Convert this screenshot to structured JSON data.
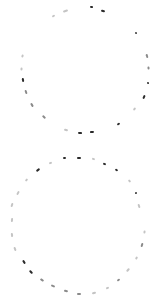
{
  "canvas": {
    "width": 159,
    "height": 304,
    "background": "#ffffff"
  },
  "colors": {
    "dark": "#2a2a2a",
    "mid": "#8a8a8a",
    "light": "#c4c4c4"
  },
  "circles": [
    {
      "name": "top-dashed-circle",
      "center": [
        85,
        72
      ],
      "radius": 62,
      "ticks": [
        {
          "x": 53,
          "y": 16,
          "shade": "light",
          "len": 3
        },
        {
          "x": 65,
          "y": 11,
          "shade": "light",
          "len": 5
        },
        {
          "x": 91,
          "y": 7,
          "shade": "dark",
          "len": 3
        },
        {
          "x": 103,
          "y": 11,
          "shade": "dark",
          "len": 4
        },
        {
          "x": 136,
          "y": 33,
          "shade": "dark",
          "len": 2
        },
        {
          "x": 147,
          "y": 56,
          "shade": "mid",
          "len": 4
        },
        {
          "x": 148,
          "y": 68,
          "shade": "mid",
          "len": 3
        },
        {
          "x": 148,
          "y": 83,
          "shade": "dark",
          "len": 2
        },
        {
          "x": 144,
          "y": 97,
          "shade": "dark",
          "len": 4
        },
        {
          "x": 134,
          "y": 109,
          "shade": "light",
          "len": 3
        },
        {
          "x": 118,
          "y": 124,
          "shade": "dark",
          "len": 3
        },
        {
          "x": 92,
          "y": 132,
          "shade": "dark",
          "len": 4
        },
        {
          "x": 80,
          "y": 133,
          "shade": "dark",
          "len": 4
        },
        {
          "x": 66,
          "y": 130,
          "shade": "light",
          "len": 4
        },
        {
          "x": 44,
          "y": 117,
          "shade": "mid",
          "len": 4
        },
        {
          "x": 32,
          "y": 105,
          "shade": "mid",
          "len": 4
        },
        {
          "x": 26,
          "y": 92,
          "shade": "mid",
          "len": 4
        },
        {
          "x": 23,
          "y": 80,
          "shade": "dark",
          "len": 4
        },
        {
          "x": 21,
          "y": 69,
          "shade": "light",
          "len": 3
        },
        {
          "x": 22,
          "y": 56,
          "shade": "light",
          "len": 3
        }
      ]
    },
    {
      "name": "bottom-dashed-circle",
      "center": [
        78,
        226
      ],
      "radius": 67,
      "ticks": [
        {
          "x": 64,
          "y": 158,
          "shade": "dark",
          "len": 3
        },
        {
          "x": 79,
          "y": 158,
          "shade": "dark",
          "len": 4
        },
        {
          "x": 93,
          "y": 159,
          "shade": "light",
          "len": 3
        },
        {
          "x": 104,
          "y": 164,
          "shade": "dark",
          "len": 3
        },
        {
          "x": 116,
          "y": 170,
          "shade": "dark",
          "len": 3
        },
        {
          "x": 129,
          "y": 181,
          "shade": "light",
          "len": 3
        },
        {
          "x": 136,
          "y": 193,
          "shade": "dark",
          "len": 2
        },
        {
          "x": 139,
          "y": 206,
          "shade": "light",
          "len": 4
        },
        {
          "x": 144,
          "y": 232,
          "shade": "light",
          "len": 3
        },
        {
          "x": 142,
          "y": 245,
          "shade": "mid",
          "len": 4
        },
        {
          "x": 136,
          "y": 258,
          "shade": "light",
          "len": 3
        },
        {
          "x": 128,
          "y": 270,
          "shade": "light",
          "len": 4
        },
        {
          "x": 118,
          "y": 280,
          "shade": "mid",
          "len": 3
        },
        {
          "x": 107,
          "y": 288,
          "shade": "light",
          "len": 3
        },
        {
          "x": 94,
          "y": 293,
          "shade": "light",
          "len": 4
        },
        {
          "x": 79,
          "y": 294,
          "shade": "mid",
          "len": 4
        },
        {
          "x": 66,
          "y": 291,
          "shade": "mid",
          "len": 4
        },
        {
          "x": 53,
          "y": 286,
          "shade": "mid",
          "len": 4
        },
        {
          "x": 42,
          "y": 280,
          "shade": "mid",
          "len": 4
        },
        {
          "x": 31,
          "y": 272,
          "shade": "dark",
          "len": 4
        },
        {
          "x": 24,
          "y": 262,
          "shade": "dark",
          "len": 4
        },
        {
          "x": 15,
          "y": 249,
          "shade": "light",
          "len": 4
        },
        {
          "x": 12,
          "y": 235,
          "shade": "light",
          "len": 4
        },
        {
          "x": 12,
          "y": 220,
          "shade": "light",
          "len": 4
        },
        {
          "x": 12,
          "y": 205,
          "shade": "light",
          "len": 4
        },
        {
          "x": 18,
          "y": 193,
          "shade": "light",
          "len": 4
        },
        {
          "x": 26,
          "y": 180,
          "shade": "light",
          "len": 3
        },
        {
          "x": 38,
          "y": 170,
          "shade": "dark",
          "len": 4
        },
        {
          "x": 50,
          "y": 163,
          "shade": "light",
          "len": 3
        }
      ]
    }
  ]
}
